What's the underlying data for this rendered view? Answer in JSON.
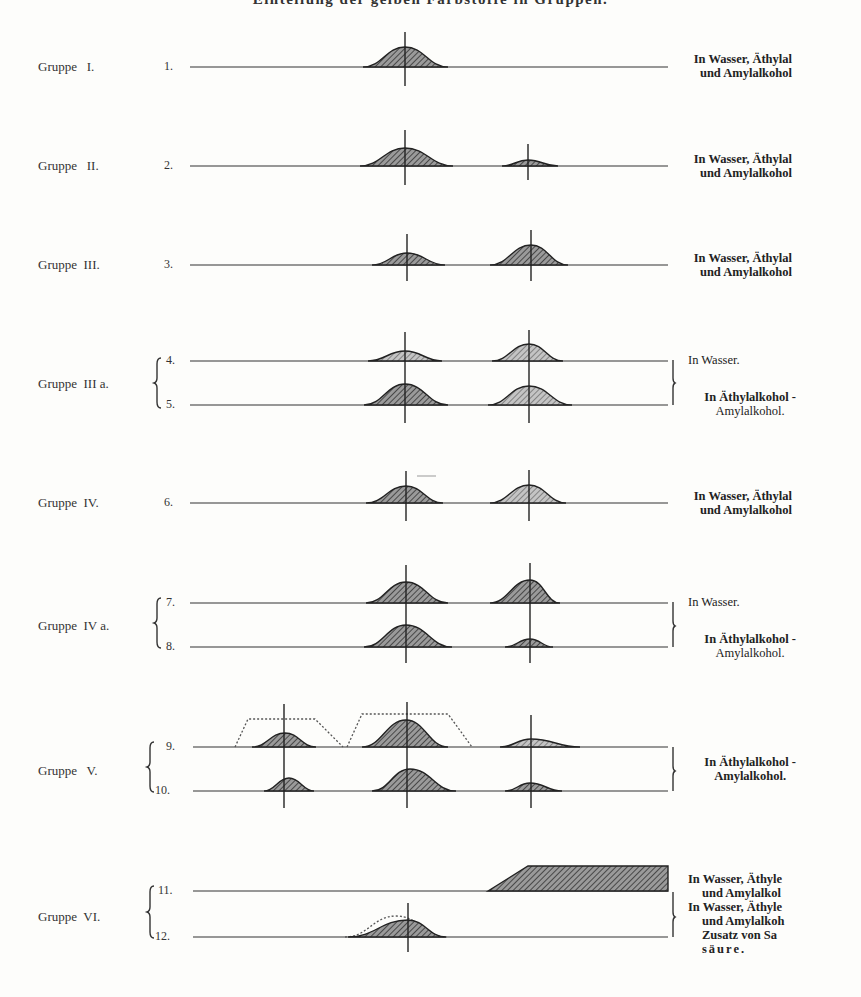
{
  "title": "Einteilung der gelben Farbstoffe in Gruppen.",
  "groups": [
    {
      "label": "Gruppe   I.",
      "rows": [
        "1."
      ]
    },
    {
      "label": "Gruppe   II.",
      "rows": [
        "2."
      ]
    },
    {
      "label": "Gruppe  III.",
      "rows": [
        "3."
      ]
    },
    {
      "label": "Gruppe  III a.",
      "rows": [
        "4.",
        "5."
      ]
    },
    {
      "label": "Gruppe  IV.",
      "rows": [
        "6."
      ]
    },
    {
      "label": "Gruppe  IV a.",
      "rows": [
        "7.",
        "8."
      ]
    },
    {
      "label": "Gruppe   V.",
      "rows": [
        "9.",
        "10."
      ]
    },
    {
      "label": "Gruppe  VI.",
      "rows": [
        "11.",
        "12."
      ]
    }
  ],
  "solvent_labels": {
    "g1": [
      "In Wasser, Äthylal",
      "und Amylalkohol"
    ],
    "g2": [
      "In Wasser, Äthylal",
      "und Amylalkohol"
    ],
    "g3": [
      "In Wasser, Äthylal",
      "und Amylalkohol"
    ],
    "g3a_top": [
      "In Wasser."
    ],
    "g3a_bottom": [
      "In Äthylalkohol -",
      "Amylalkohol."
    ],
    "g4": [
      "In Wasser, Äthylal",
      "und Amylalkohol"
    ],
    "g4a_top": [
      "In Wasser."
    ],
    "g4a_bottom": [
      "In Äthylalkohol -",
      "Amylalkohol."
    ],
    "g5": [
      "In Äthylalkohol -",
      "Amylalkohol."
    ],
    "g6": [
      "In Wasser, Äthyle",
      "und Amylalkol",
      "In Wasser, Äthyle",
      "und Amylalkoh",
      "Zusatz von Sa",
      "säure."
    ]
  },
  "chart_data": {
    "type": "area",
    "title": "Einteilung der gelben Farbstoffe in Gruppen.",
    "reference_lines_x": [
      287,
      406,
      530
    ],
    "xlabel": "",
    "ylabel": "",
    "rows": [
      {
        "row": "1.",
        "group": "I",
        "baseline_y": 67,
        "bands": [
          {
            "center": 405,
            "from": 363,
            "to": 448,
            "height": 20
          }
        ]
      },
      {
        "row": "2.",
        "group": "II",
        "baseline_y": 166,
        "bands": [
          {
            "center": 405,
            "from": 360,
            "to": 453,
            "height": 18
          },
          {
            "center": 528,
            "from": 502,
            "to": 558,
            "height": 6
          }
        ]
      },
      {
        "row": "3.",
        "group": "III",
        "baseline_y": 265,
        "bands": [
          {
            "center": 407,
            "from": 372,
            "to": 445,
            "height": 12
          },
          {
            "center": 531,
            "from": 490,
            "to": 568,
            "height": 20
          }
        ]
      },
      {
        "row": "4.",
        "group": "IIIa",
        "baseline_y": 361,
        "bands": [
          {
            "center": 405,
            "from": 368,
            "to": 442,
            "height": 10
          },
          {
            "center": 529,
            "from": 492,
            "to": 563,
            "height": 17
          }
        ]
      },
      {
        "row": "5.",
        "group": "IIIa",
        "baseline_y": 405,
        "bands": [
          {
            "center": 405,
            "from": 364,
            "to": 448,
            "height": 21
          },
          {
            "center": 529,
            "from": 488,
            "to": 572,
            "height": 19
          }
        ]
      },
      {
        "row": "6.",
        "group": "IV",
        "baseline_y": 503,
        "bands": [
          {
            "center": 406,
            "from": 366,
            "to": 443,
            "height": 17
          },
          {
            "center": 529,
            "from": 490,
            "to": 566,
            "height": 18
          }
        ]
      },
      {
        "row": "7.",
        "group": "IVa",
        "baseline_y": 603,
        "bands": [
          {
            "center": 406,
            "from": 366,
            "to": 448,
            "height": 21
          },
          {
            "center": 530,
            "from": 490,
            "to": 560,
            "height": 23
          }
        ]
      },
      {
        "row": "8.",
        "group": "IVa",
        "baseline_y": 647,
        "bands": [
          {
            "center": 406,
            "from": 364,
            "to": 452,
            "height": 22
          },
          {
            "center": 530,
            "from": 505,
            "to": 553,
            "height": 8
          }
        ]
      },
      {
        "row": "9.",
        "group": "V",
        "baseline_y": 747,
        "bands": [
          {
            "center": 285,
            "from": 252,
            "to": 316,
            "height": 14
          },
          {
            "center": 406,
            "from": 362,
            "to": 448,
            "height": 27
          },
          {
            "center": 531,
            "from": 500,
            "to": 580,
            "height": 8
          }
        ],
        "dotted_envelope": [
          {
            "from": 235,
            "to": 343,
            "plateau_from": 248,
            "plateau_to": 315,
            "height": 28
          },
          {
            "from": 347,
            "to": 472,
            "plateau_from": 362,
            "plateau_to": 448,
            "height": 33
          }
        ]
      },
      {
        "row": "10.",
        "group": "V",
        "baseline_y": 791,
        "bands": [
          {
            "center": 289,
            "from": 264,
            "to": 314,
            "height": 13
          },
          {
            "center": 410,
            "from": 372,
            "to": 456,
            "height": 22
          },
          {
            "center": 530,
            "from": 505,
            "to": 562,
            "height": 8
          }
        ]
      },
      {
        "row": "11.",
        "group": "VI",
        "baseline_y": 891,
        "bands": [
          {
            "type": "end_absorption",
            "from": 488,
            "ramp_to": 528,
            "to": 668,
            "height": 25
          }
        ]
      },
      {
        "row": "12.",
        "group": "VI",
        "baseline_y": 937,
        "bands": [
          {
            "center": 408,
            "from": 348,
            "to": 446,
            "height": 17
          }
        ],
        "dotted_envelope": [
          {
            "from": 345,
            "to": 447,
            "height": 21
          }
        ]
      }
    ]
  }
}
